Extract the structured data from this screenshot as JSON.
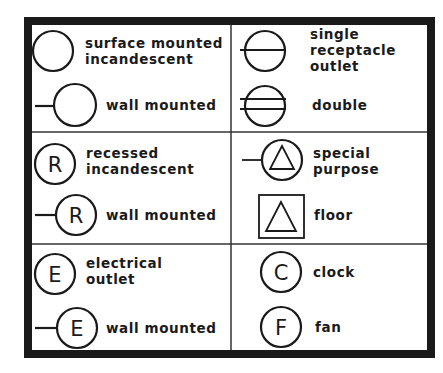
{
  "legend": {
    "cells": [
      {
        "id": "surface-mounted-incandescent",
        "label": "surface mounted\nincandescent",
        "symbol": "circle",
        "letter": ""
      },
      {
        "id": "surface-wall-mounted",
        "label": "wall mounted",
        "symbol": "circle-wall-stub",
        "letter": ""
      },
      {
        "id": "single-receptacle-outlet",
        "label": "single\nreceptacle\noutlet",
        "symbol": "circle-single-line",
        "letter": ""
      },
      {
        "id": "double-receptacle",
        "label": "double",
        "symbol": "circle-double-line",
        "letter": ""
      },
      {
        "id": "recessed-incandescent",
        "label": "recessed\nincandescent",
        "symbol": "circle-letter",
        "letter": "R"
      },
      {
        "id": "recessed-wall-mounted",
        "label": "wall mounted",
        "symbol": "circle-letter-wall-stub",
        "letter": "R"
      },
      {
        "id": "special-purpose",
        "label": "special\npurpose",
        "symbol": "circle-triangle-stub",
        "letter": ""
      },
      {
        "id": "floor",
        "label": "floor",
        "symbol": "square-triangle",
        "letter": ""
      },
      {
        "id": "electrical-outlet",
        "label": "electrical\noutlet",
        "symbol": "circle-letter",
        "letter": "E"
      },
      {
        "id": "electrical-wall-mounted",
        "label": "wall mounted",
        "symbol": "circle-letter-wall-stub",
        "letter": "E"
      },
      {
        "id": "clock",
        "label": "clock",
        "symbol": "circle-letter",
        "letter": "C"
      },
      {
        "id": "fan",
        "label": "fan",
        "symbol": "circle-letter",
        "letter": "F"
      }
    ],
    "colors": {
      "ink": "#1a1a1a",
      "paper": "#ffffff"
    }
  }
}
